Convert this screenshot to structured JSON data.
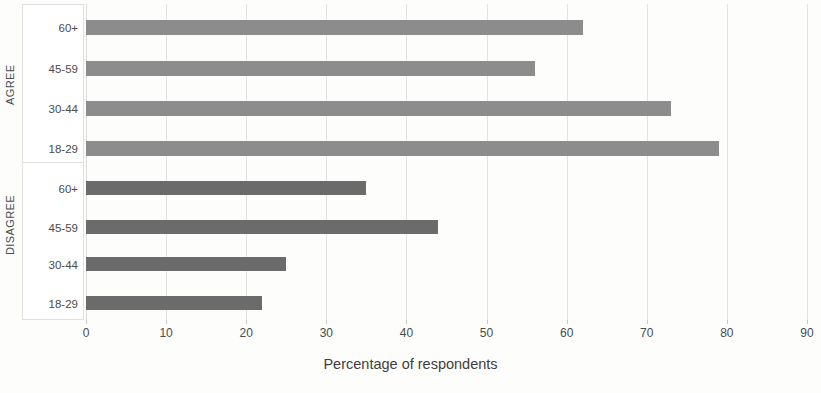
{
  "chart_data": {
    "type": "bar",
    "orientation": "horizontal",
    "title": "",
    "xlabel": "Percentage of respondents",
    "ylabel": "",
    "xlim": [
      0,
      90
    ],
    "xticks": [
      0,
      10,
      20,
      30,
      40,
      50,
      60,
      70,
      80,
      90
    ],
    "grid": true,
    "legend": "none",
    "groups": [
      {
        "name": "AGREE",
        "color": "#8c8c8c",
        "categories": [
          "60+",
          "45-59",
          "30-44",
          "18-29"
        ],
        "values": [
          62,
          56,
          73,
          79
        ]
      },
      {
        "name": "DISAGREE",
        "color": "#6b6b6b",
        "categories": [
          "60+",
          "45-59",
          "30-44",
          "18-29"
        ],
        "values": [
          35,
          44,
          25,
          22
        ]
      }
    ],
    "bars": [
      {
        "group": "AGREE",
        "category": "60+",
        "value": 62,
        "color": "#8c8c8c"
      },
      {
        "group": "AGREE",
        "category": "45-59",
        "value": 56,
        "color": "#8c8c8c"
      },
      {
        "group": "AGREE",
        "category": "30-44",
        "value": 73,
        "color": "#8c8c8c"
      },
      {
        "group": "AGREE",
        "category": "18-29",
        "value": 79,
        "color": "#8c8c8c"
      },
      {
        "group": "DISAGREE",
        "category": "60+",
        "value": 35,
        "color": "#6b6b6b"
      },
      {
        "group": "DISAGREE",
        "category": "45-59",
        "value": 44,
        "color": "#6b6b6b"
      },
      {
        "group": "DISAGREE",
        "category": "30-44",
        "value": 25,
        "color": "#6b6b6b"
      },
      {
        "group": "DISAGREE",
        "category": "18-29",
        "value": 22,
        "color": "#6b6b6b"
      }
    ]
  },
  "axis": {
    "x_title": "Percentage of respondents",
    "tick_labels": [
      "0",
      "10",
      "20",
      "30",
      "40",
      "50",
      "60",
      "70",
      "80",
      "90"
    ]
  },
  "categories": {
    "agree_group_label": "AGREE",
    "disagree_group_label": "DISAGREE",
    "labels": [
      "60+",
      "45-59",
      "30-44",
      "18-29",
      "60+",
      "45-59",
      "30-44",
      "18-29"
    ]
  },
  "colors": {
    "agree_bar": "#8c8c8c",
    "disagree_bar": "#6b6b6b",
    "gridline": "#e3e3e1",
    "background": "#fdfdfc",
    "text": "#3a3a3a"
  }
}
